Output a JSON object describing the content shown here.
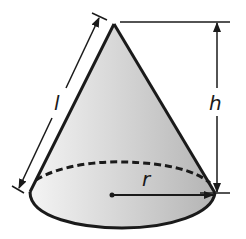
{
  "diagram": {
    "labels": {
      "slant_height": "l",
      "height": "h",
      "radius": "r"
    },
    "colors": {
      "stroke": "#1a1a1a",
      "fill_light": "#f2f2f2",
      "fill_dark": "#b8b8b8",
      "background": "#ffffff"
    }
  }
}
